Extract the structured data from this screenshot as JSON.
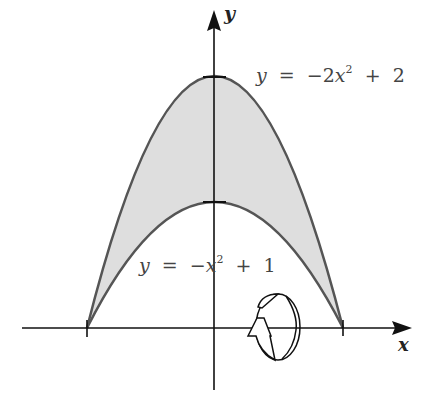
{
  "figure": {
    "x_axis_label": "x",
    "y_axis_label": "y",
    "upper_curve": {
      "equation_lhs": "y",
      "equals": "=",
      "minus": "−",
      "coef": "2",
      "var": "x",
      "exp": "2",
      "plus": "+",
      "const": "2"
    },
    "lower_curve": {
      "equation_lhs": "y",
      "equals": "=",
      "minus": "−",
      "coef": "",
      "var": "x",
      "exp": "2",
      "plus": "+",
      "const": "1"
    },
    "region_fill": "#dcdcdc",
    "curve_color": "#555555",
    "axis_color": "#111111",
    "rotation_icon": "rotation-about-x-axis-icon",
    "x_ticks": [
      -1,
      1
    ],
    "y_ticks": [
      1,
      2
    ]
  }
}
